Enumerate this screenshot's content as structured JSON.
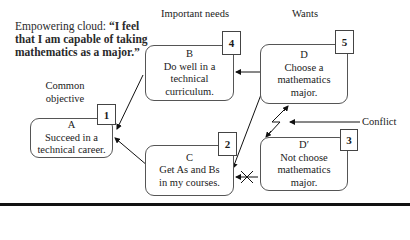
{
  "title": {
    "prefix": "Empowering cloud: ",
    "quote_open": "“I",
    "quote_rest": "feel that I am capable of taking mathematics as a major.”"
  },
  "labels": {
    "important_needs": "Important needs",
    "wants": "Wants",
    "common_objective_line1": "Common",
    "common_objective_line2": "objective",
    "conflict": "Conflict"
  },
  "boxes": {
    "A": {
      "letter": "A",
      "line1": "Succeed in a",
      "line2": "technical career.",
      "badge": "1"
    },
    "B": {
      "letter": "B",
      "line1": "Do well in a",
      "line2": "technical",
      "line3": "curriculum.",
      "badge": "4"
    },
    "C": {
      "letter": "C",
      "line1": "Get As and Bs",
      "line2": "in my courses.",
      "badge": "2"
    },
    "D": {
      "letter": "D",
      "line1": "Choose a",
      "line2": "mathematics",
      "line3": "major.",
      "badge": "5"
    },
    "Dprime": {
      "letter": "D′",
      "line1": "Not choose",
      "line2": "mathematics",
      "line3": "major.",
      "badge": "3"
    }
  }
}
